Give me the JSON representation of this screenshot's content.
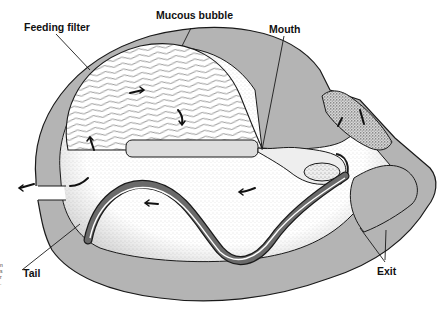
{
  "diagram": {
    "labels": {
      "feeding_filter": "Feeding filter",
      "mucous_bubble": "Mucous bubble",
      "mouth": "Mouth",
      "tail": "Tail",
      "exit": "Exit"
    },
    "edge_fragment": [
      "n",
      "s",
      "r",
      "."
    ],
    "colors": {
      "house_wall": "#b4b4b4",
      "outline": "#1a1a1a",
      "interior": "#ffffff",
      "background": "#ffffff",
      "stipple": "#555555"
    },
    "flow_arrows": 9
  }
}
